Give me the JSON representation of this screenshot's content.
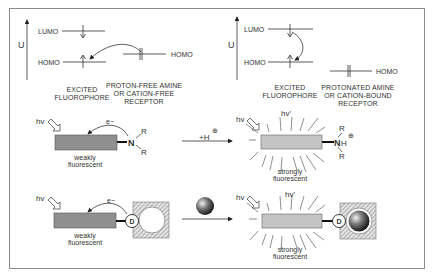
{
  "panel_left": {
    "axis_label": "U",
    "lumo_label": "LUMO",
    "homo_label": "HOMO",
    "receptor_homo_label": "HOMO",
    "fluorophore_caption": [
      "EXCITED",
      "FLUOROPHORE"
    ],
    "receptor_caption": [
      "PROTON-FREE AMINE",
      "OR CATION-FREE",
      "RECEPTOR"
    ]
  },
  "panel_right": {
    "axis_label": "U",
    "lumo_label": "LUMO",
    "homo_label": "HOMO",
    "receptor_homo_label": "HOMO",
    "fluorophore_caption": [
      "EXCITED",
      "FLUOROPHORE"
    ],
    "receptor_caption": [
      "PROTONATED AMINE",
      "OR CATION-BOUND",
      "RECEPTOR"
    ]
  },
  "row_amine": {
    "excitation_label": "hv",
    "electron_label": "e−",
    "nitrogen": "N",
    "substituent": "R",
    "state_before": [
      "weakly",
      "fluorescent"
    ],
    "reagent_label": "+H",
    "reagent_charge": "⊕",
    "emission_label": "hv'",
    "protonated_n": "N",
    "protonated_h": "H",
    "protonated_charge": "⊕",
    "state_after": [
      "strongly",
      "fluorescent"
    ]
  },
  "row_cation": {
    "excitation_label": "hv",
    "electron_label": "e−",
    "donor_label": "D",
    "state_before": [
      "weakly",
      "fluorescent"
    ],
    "emission_label": "hv'",
    "state_after": [
      "strongly",
      "fluorescent"
    ]
  },
  "colors": {
    "frame": "#8a8a8a",
    "fluorophore_dim": "#8f8f8f",
    "fluorophore_bright": "#c4c4c4",
    "line": "#333333",
    "receptor_hatch": "#9a9a9a",
    "cation": "#3a3a3a"
  }
}
